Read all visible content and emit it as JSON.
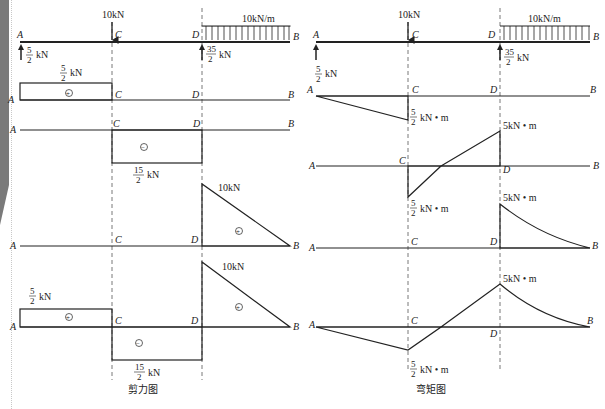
{
  "figure": {
    "left_panel": {
      "caption": "剪力图",
      "loading": {
        "point_load": "10kN",
        "distributed_load": "10kN/m",
        "reaction_A": {
          "num": "5",
          "den": "2",
          "unit": "kN"
        },
        "reaction_D": {
          "num": "35",
          "den": "2",
          "unit": "kN"
        }
      },
      "sfd_1": {
        "value": {
          "num": "5",
          "den": "2",
          "unit": "kN"
        },
        "sign": "+"
      },
      "sfd_2": {
        "value": {
          "num": "15",
          "den": "2",
          "unit": "kN"
        },
        "sign": "−"
      },
      "sfd_3": {
        "value": "10kN",
        "sign": "+"
      },
      "sfd_total": {
        "value_AC": {
          "num": "5",
          "den": "2",
          "unit": "kN"
        },
        "value_CD": {
          "num": "15",
          "den": "2",
          "unit": "kN"
        },
        "value_DB": "10kN",
        "signs": [
          "+",
          "−",
          "+"
        ]
      }
    },
    "right_panel": {
      "caption": "弯矩图",
      "loading": {
        "point_load": "10kN",
        "distributed_load": "10kN/m",
        "reaction_A": {
          "num": "5",
          "den": "2",
          "unit": "kN"
        },
        "reaction_D": {
          "num": "35",
          "den": "2",
          "unit": "kN"
        }
      },
      "bmd_1": {
        "value_C": {
          "num": "5",
          "den": "2",
          "unit": "kN • m"
        }
      },
      "bmd_2": {
        "value_D": "5kN • m",
        "value_C": {
          "num": "5",
          "den": "2",
          "unit": "kN • m"
        }
      },
      "bmd_3": {
        "value_D": "5kN • m"
      },
      "bmd_total": {
        "value_D": "5kN • m",
        "value_C": {
          "num": "5",
          "den": "2",
          "unit": "kN • m"
        }
      }
    },
    "points": {
      "A": "A",
      "B": "B",
      "C": "C",
      "D": "D"
    },
    "colors": {
      "line": "#222222",
      "hatch": "#444444",
      "page_edge": "#7a7a7a"
    }
  }
}
